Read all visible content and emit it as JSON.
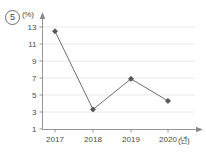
{
  "question_number": "5",
  "labels": {
    "y_unit": "(%)",
    "x_unit": "(년)"
  },
  "chart_data": {
    "type": "line",
    "title": "",
    "xlabel": "(년)",
    "ylabel": "(%)",
    "categories": [
      "2017",
      "2018",
      "2019",
      "2020"
    ],
    "values": [
      12.5,
      3.3,
      6.9,
      4.3
    ],
    "ytick_labels": [
      "13",
      "11",
      "9",
      "7",
      "5",
      "3",
      "1"
    ],
    "ytick_values": [
      13,
      11,
      9,
      7,
      5,
      3,
      1
    ],
    "ylim": [
      1,
      13.8
    ],
    "grid": true,
    "legend": "none",
    "marker": "diamond",
    "line_color": "#6e6e6e",
    "marker_color": "#5a5a5a",
    "grid_color": "#e4e4e4",
    "axis_color": "#8a8a8a"
  }
}
